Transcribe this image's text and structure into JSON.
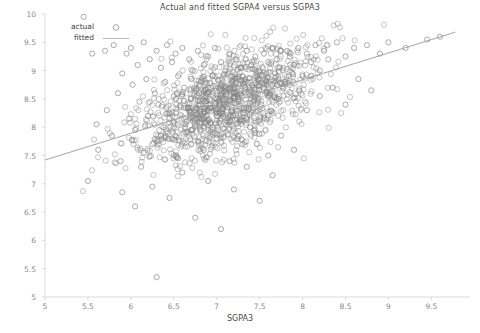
{
  "chart_data": {
    "type": "scatter",
    "title": "Actual and fitted SGPA4 versus SGPA3",
    "xlabel": "SGPA3",
    "ylabel": "SGPA4",
    "xlim": [
      5,
      9.95
    ],
    "ylim": [
      5,
      10
    ],
    "xticks": [
      5,
      5.5,
      6,
      6.5,
      7,
      7.5,
      8,
      8.5,
      9,
      9.5
    ],
    "yticks": [
      5,
      5.5,
      6,
      6.5,
      7,
      7.5,
      8,
      8.5,
      9,
      9.5,
      10
    ],
    "xtick_labels": [
      "5",
      "5.5",
      "6",
      "6.5",
      "7",
      "7.5",
      "8",
      "8.5",
      "9",
      "9.5"
    ],
    "ytick_labels": [
      "5",
      "5.5",
      "6",
      "6.5",
      "7",
      "7.5",
      "8",
      "8.5",
      "9",
      "9.5",
      "10"
    ],
    "grid": false,
    "legend_position": "upper left",
    "series": [
      {
        "name": "actual",
        "type": "scatter",
        "marker": "open-circle",
        "color": "#808080",
        "points": [
          [
            5.45,
            9.95
          ],
          [
            5.5,
            7.05
          ],
          [
            5.55,
            9.3
          ],
          [
            5.6,
            8.05
          ],
          [
            5.62,
            7.6
          ],
          [
            5.7,
            9.35
          ],
          [
            5.72,
            8.3
          ],
          [
            5.78,
            7.85
          ],
          [
            5.8,
            9.45
          ],
          [
            5.85,
            8.6
          ],
          [
            5.88,
            7.4
          ],
          [
            5.9,
            8.95
          ],
          [
            5.95,
            9.3
          ],
          [
            5.98,
            8.15
          ],
          [
            6.0,
            9.4
          ],
          [
            6.02,
            8.75
          ],
          [
            6.05,
            7.95
          ],
          [
            6.08,
            9.1
          ],
          [
            6.1,
            8.45
          ],
          [
            6.12,
            7.3
          ],
          [
            6.15,
            9.5
          ],
          [
            6.18,
            8.85
          ],
          [
            6.2,
            8.2
          ],
          [
            6.22,
            9.2
          ],
          [
            6.25,
            7.7
          ],
          [
            6.28,
            8.6
          ],
          [
            6.3,
            5.35
          ],
          [
            6.3,
            9.35
          ],
          [
            6.32,
            8.4
          ],
          [
            6.35,
            9.05
          ],
          [
            6.38,
            8.0
          ],
          [
            6.4,
            8.8
          ],
          [
            6.42,
            9.45
          ],
          [
            6.45,
            8.25
          ],
          [
            6.48,
            9.15
          ],
          [
            6.5,
            8.55
          ],
          [
            6.5,
            7.5
          ],
          [
            6.52,
            9.3
          ],
          [
            6.55,
            8.9
          ],
          [
            6.58,
            8.35
          ],
          [
            6.6,
            9.4
          ],
          [
            6.62,
            8.7
          ],
          [
            6.65,
            8.1
          ],
          [
            6.68,
            9.2
          ],
          [
            6.7,
            8.5
          ],
          [
            6.72,
            9.0
          ],
          [
            6.75,
            8.3
          ],
          [
            6.78,
            9.35
          ],
          [
            6.8,
            8.75
          ],
          [
            6.82,
            8.15
          ],
          [
            6.85,
            9.1
          ],
          [
            6.88,
            8.6
          ],
          [
            6.9,
            9.25
          ],
          [
            6.92,
            8.4
          ],
          [
            6.95,
            8.9
          ],
          [
            6.98,
            9.4
          ],
          [
            7.0,
            8.2
          ],
          [
            7.02,
            8.7
          ],
          [
            7.05,
            9.15
          ],
          [
            7.08,
            8.5
          ],
          [
            7.1,
            9.0
          ],
          [
            7.12,
            8.35
          ],
          [
            7.15,
            9.3
          ],
          [
            7.18,
            8.8
          ],
          [
            7.2,
            8.6
          ],
          [
            7.22,
            9.2
          ],
          [
            7.25,
            8.45
          ],
          [
            7.28,
            9.05
          ],
          [
            7.3,
            8.9
          ],
          [
            7.32,
            8.25
          ],
          [
            7.35,
            9.35
          ],
          [
            7.38,
            8.7
          ],
          [
            7.4,
            9.1
          ],
          [
            7.42,
            8.55
          ],
          [
            7.45,
            9.25
          ],
          [
            7.48,
            8.85
          ],
          [
            7.5,
            9.0
          ],
          [
            7.52,
            8.4
          ],
          [
            7.55,
            9.3
          ],
          [
            7.58,
            8.75
          ],
          [
            7.6,
            9.15
          ],
          [
            7.62,
            8.6
          ],
          [
            7.65,
            9.4
          ],
          [
            7.68,
            8.95
          ],
          [
            7.7,
            9.2
          ],
          [
            7.72,
            8.5
          ],
          [
            7.75,
            9.35
          ],
          [
            7.78,
            9.05
          ],
          [
            7.8,
            8.8
          ],
          [
            7.85,
            9.25
          ],
          [
            7.9,
            9.1
          ],
          [
            7.95,
            9.4
          ],
          [
            8.0,
            8.9
          ],
          [
            8.05,
            9.3
          ],
          [
            8.1,
            9.15
          ],
          [
            8.15,
            9.45
          ],
          [
            8.2,
            9.0
          ],
          [
            8.25,
            9.35
          ],
          [
            8.3,
            9.2
          ],
          [
            8.4,
            9.5
          ],
          [
            8.5,
            9.25
          ],
          [
            8.6,
            9.4
          ],
          [
            8.75,
            9.45
          ],
          [
            8.9,
            9.3
          ],
          [
            9.0,
            9.5
          ],
          [
            9.2,
            9.4
          ],
          [
            9.45,
            9.55
          ],
          [
            9.6,
            9.6
          ],
          [
            5.9,
            6.85
          ],
          [
            6.05,
            6.6
          ],
          [
            6.25,
            6.95
          ],
          [
            6.45,
            6.75
          ],
          [
            6.6,
            7.2
          ],
          [
            6.75,
            6.4
          ],
          [
            6.9,
            7.05
          ],
          [
            7.05,
            6.2
          ],
          [
            7.2,
            6.9
          ],
          [
            7.35,
            7.3
          ],
          [
            7.5,
            6.7
          ],
          [
            7.65,
            7.15
          ],
          [
            6.15,
            7.55
          ],
          [
            6.35,
            7.85
          ],
          [
            6.55,
            7.45
          ],
          [
            6.7,
            7.95
          ],
          [
            6.85,
            7.6
          ],
          [
            7.0,
            7.8
          ],
          [
            7.15,
            7.4
          ],
          [
            7.3,
            7.7
          ],
          [
            7.45,
            7.9
          ],
          [
            7.6,
            7.5
          ],
          [
            7.75,
            7.85
          ],
          [
            7.9,
            7.6
          ],
          [
            8.05,
            8.3
          ],
          [
            8.2,
            8.55
          ],
          [
            8.35,
            8.7
          ],
          [
            8.5,
            8.4
          ],
          [
            8.65,
            8.85
          ],
          [
            8.8,
            8.65
          ]
        ]
      },
      {
        "name": "fitted",
        "type": "line",
        "color": "#9a9a9a",
        "endpoints": [
          [
            5.0,
            7.42
          ],
          [
            9.78,
            9.68
          ]
        ],
        "slope": 0.473,
        "intercept": 5.055
      }
    ]
  },
  "legend": {
    "entries": [
      {
        "label": "actual",
        "marker": "open-circle"
      },
      {
        "label": "fitted",
        "marker": "line"
      }
    ]
  }
}
